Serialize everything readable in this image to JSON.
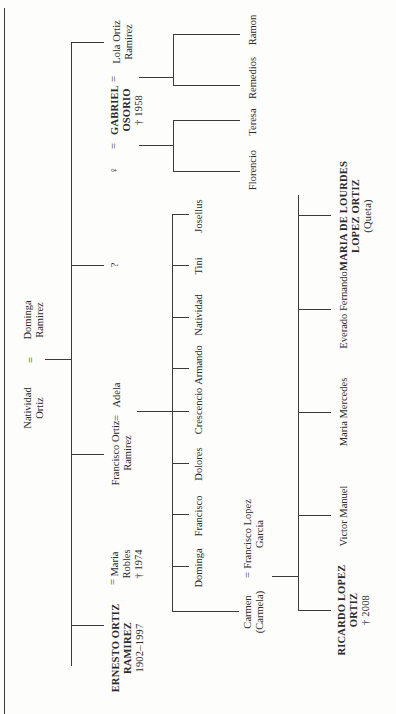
{
  "diagram": {
    "type": "family-tree",
    "orientation": "rotated-90-ccw",
    "line_color": "#3a3a3a",
    "text_color": "#2a2a2a",
    "background": "#fdfdfc"
  },
  "generation1": {
    "husband": {
      "name_line1": "Natividad",
      "name_line2": "Ortiz"
    },
    "marriage_symbol": "=",
    "wife": {
      "name_line1": "Dominga",
      "name_line2": "Ramirez"
    }
  },
  "generation2": {
    "ernesto": {
      "name_line1": "ERNESTO ORTIZ",
      "name_line2": "RAMIREZ",
      "dates": "1902–1997",
      "marriage_symbol": "=",
      "spouse_line1": "Maria",
      "spouse_line2": "Robles",
      "spouse_death": "† 1974"
    },
    "francisco": {
      "name_line1": "Francisco Ortiz",
      "name_line2": "Ramirez",
      "marriage_symbol": "=",
      "spouse": "Adela"
    },
    "unknown": {
      "name": "?"
    },
    "lola": {
      "female_symbol": "♀",
      "marriage_symbol_1": "=",
      "spouse_line1": "GABRIEL",
      "spouse_line2": "OSORIO",
      "spouse_death": "† 1958",
      "marriage_symbol_2": "=",
      "name_line1": "Lola Ortiz",
      "name_line2": "Ramirez"
    }
  },
  "generation3": {
    "francisco_children": [
      "Carmen",
      "Dominga",
      "Francisco",
      "Dolores",
      "Crescencio",
      "Armando",
      "Natividad",
      "Tini",
      "Josellus"
    ],
    "carmen": {
      "name_line1": "Carmen",
      "name_line2": "(Carmela)",
      "marriage_symbol": "=",
      "spouse_line1": "Francisco Lopez",
      "spouse_line2": "Garcia"
    },
    "osorio_children_group1": [
      "Florencio",
      "Teresa"
    ],
    "osorio_children_group2": [
      "Remedios",
      "Ramon"
    ]
  },
  "generation4": {
    "ricardo": {
      "name_line1": "RICARDO LOPEZ",
      "name_line2": "ORTIZ",
      "death": "† 2008"
    },
    "others": [
      "Victor Manuel",
      "Maria Mercedes",
      "Everado Fernando"
    ],
    "maria_lourdes": {
      "name_line1": "MARIA DE LOURDES",
      "name_line2": "LOPEZ  ORTIZ",
      "nickname": "(Queta)"
    }
  }
}
